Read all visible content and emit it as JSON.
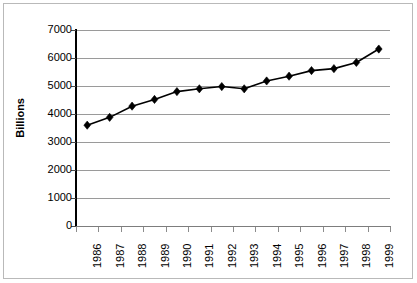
{
  "chart_data": {
    "type": "line",
    "title": "",
    "xlabel": "",
    "ylabel": "Billions",
    "categories": [
      "1986",
      "1987",
      "1988",
      "1989",
      "1990",
      "1991",
      "1992",
      "1993",
      "1994",
      "1995",
      "1996",
      "1997",
      "1998",
      "1999"
    ],
    "values": [
      3600,
      3880,
      4280,
      4520,
      4800,
      4900,
      4980,
      4900,
      5180,
      5350,
      5550,
      5620,
      5840,
      6320
    ],
    "ylim": [
      0,
      7000
    ],
    "yticks": [
      0,
      1000,
      2000,
      3000,
      4000,
      5000,
      6000,
      7000
    ],
    "ytick_labels": [
      "0",
      "1000",
      "2000",
      "3000",
      "4000",
      "5000",
      "6000",
      "7000"
    ],
    "grid": "horizontal",
    "legend": "none",
    "series": [
      {
        "name": "Billions",
        "marker": "diamond",
        "line_color": "#000000",
        "marker_color": "#000000",
        "values": [
          3600,
          3880,
          4280,
          4520,
          4800,
          4900,
          4980,
          4900,
          5180,
          5350,
          5550,
          5620,
          5840,
          6320
        ]
      }
    ],
    "colors": {
      "line": "#000000",
      "marker": "#000000",
      "grid": "#9a9a9a",
      "axis": "#000000",
      "background": "#ffffff",
      "frame": "#b9b9b9"
    }
  }
}
